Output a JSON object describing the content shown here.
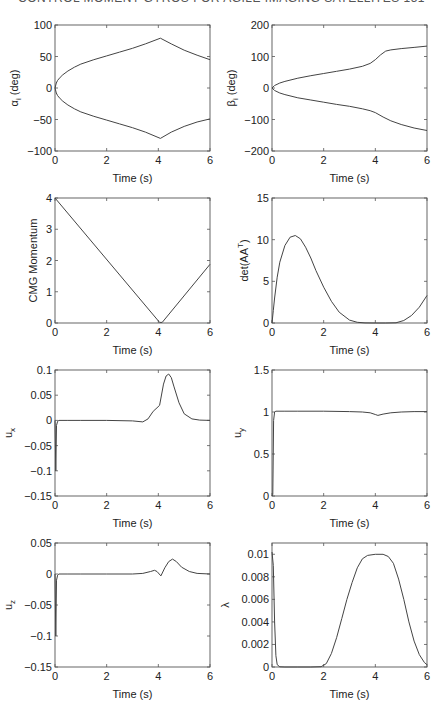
{
  "page": {
    "running_head": "CONTROL MOMENT GYROS FOR AGILE IMAGING SATELLITES 151"
  },
  "chart_data": [
    {
      "id": "alpha",
      "type": "line",
      "title": "",
      "xlabel": "Time (s)",
      "ylabel": "α_i (deg)",
      "ylabel_main": "α",
      "ylabel_sub": "i",
      "ylabel_tail": " (deg)",
      "xlim": [
        0,
        6
      ],
      "ylim": [
        -100,
        100
      ],
      "xticks": [
        0,
        2,
        4,
        6
      ],
      "yticks": [
        -100,
        -50,
        0,
        50,
        100
      ],
      "xtick_labels": [
        "0",
        "2",
        "4",
        "6"
      ],
      "ytick_labels": [
        "−100",
        "−50",
        "0",
        "50",
        "100"
      ],
      "grid": false,
      "series": [
        {
          "name": "alpha_upper",
          "x": [
            0,
            0.05,
            0.1,
            0.2,
            0.3,
            0.5,
            0.75,
            1,
            1.5,
            2,
            2.5,
            3,
            3.5,
            4.08,
            4.5,
            5,
            5.5,
            6
          ],
          "y": [
            0,
            8,
            12,
            17,
            21,
            27,
            33,
            38,
            45,
            51,
            57,
            63,
            70,
            79,
            70,
            60,
            52,
            45
          ]
        },
        {
          "name": "alpha_lower",
          "x": [
            0,
            0.05,
            0.1,
            0.2,
            0.3,
            0.5,
            0.75,
            1,
            1.5,
            2,
            2.5,
            3,
            3.5,
            4.08,
            4.5,
            5,
            5.5,
            6
          ],
          "y": [
            0,
            -8,
            -12,
            -17,
            -21,
            -27,
            -33,
            -38,
            -45,
            -51,
            -57,
            -63,
            -70,
            -80,
            -70,
            -61,
            -54,
            -49
          ]
        }
      ]
    },
    {
      "id": "beta",
      "type": "line",
      "title": "",
      "xlabel": "Time (s)",
      "ylabel": "β_i (deg)",
      "ylabel_main": "β",
      "ylabel_sub": "i",
      "ylabel_tail": " (deg)",
      "xlim": [
        0,
        6
      ],
      "ylim": [
        -200,
        200
      ],
      "xticks": [
        0,
        2,
        4,
        6
      ],
      "yticks": [
        -200,
        -100,
        0,
        100,
        200
      ],
      "xtick_labels": [
        "0",
        "2",
        "4",
        "6"
      ],
      "ytick_labels": [
        "−200",
        "−100",
        "0",
        "100",
        "200"
      ],
      "grid": false,
      "series": [
        {
          "name": "beta_upper",
          "x": [
            0,
            0.1,
            0.3,
            0.5,
            1,
            1.5,
            2,
            2.5,
            3,
            3.5,
            3.8,
            4,
            4.2,
            4.4,
            4.6,
            5,
            5.5,
            6
          ],
          "y": [
            0,
            8,
            16,
            21,
            31,
            39,
            46,
            53,
            60,
            69,
            78,
            90,
            105,
            117,
            121,
            125,
            129,
            133
          ]
        },
        {
          "name": "beta_lower",
          "x": [
            0,
            0.1,
            0.3,
            0.5,
            1,
            1.5,
            2,
            2.5,
            3,
            3.5,
            3.8,
            4,
            4.3,
            4.6,
            5,
            5.5,
            6
          ],
          "y": [
            0,
            -8,
            -16,
            -21,
            -31,
            -38,
            -45,
            -52,
            -58,
            -66,
            -72,
            -78,
            -92,
            -104,
            -116,
            -127,
            -135
          ]
        }
      ]
    },
    {
      "id": "cmg_momentum",
      "type": "line",
      "title": "",
      "xlabel": "Time (s)",
      "ylabel": "CMG Momentum",
      "ylabel_main": "CMG Momentum",
      "ylabel_sub": "",
      "ylabel_tail": "",
      "xlim": [
        0,
        6
      ],
      "ylim": [
        0,
        4
      ],
      "xticks": [
        0,
        2,
        4,
        6
      ],
      "yticks": [
        0,
        1,
        2,
        3,
        4
      ],
      "xtick_labels": [
        "0",
        "2",
        "4",
        "6"
      ],
      "ytick_labels": [
        "0",
        "1",
        "2",
        "3",
        "4"
      ],
      "grid": false,
      "series": [
        {
          "name": "momentum",
          "x": [
            0,
            4.05,
            4.15,
            6
          ],
          "y": [
            4,
            0.02,
            0.02,
            1.88
          ]
        }
      ]
    },
    {
      "id": "det_AAT",
      "type": "line",
      "title": "",
      "xlabel": "Time (s)",
      "ylabel": "det(AA^T)",
      "ylabel_main": "det(AA",
      "ylabel_sup": "T",
      "ylabel_tail": ")",
      "xlim": [
        0,
        6
      ],
      "ylim": [
        0,
        15
      ],
      "xticks": [
        0,
        2,
        4,
        6
      ],
      "yticks": [
        0,
        5,
        10,
        15
      ],
      "xtick_labels": [
        "0",
        "2",
        "4",
        "6"
      ],
      "ytick_labels": [
        "0",
        "5",
        "10",
        "15"
      ],
      "grid": false,
      "series": [
        {
          "name": "det",
          "x": [
            0,
            0.05,
            0.1,
            0.2,
            0.3,
            0.5,
            0.7,
            0.9,
            1.1,
            1.3,
            1.5,
            1.7,
            2,
            2.3,
            2.6,
            3,
            3.3,
            3.6,
            4,
            4.4,
            4.8,
            5.1,
            5.4,
            5.7,
            6
          ],
          "y": [
            0,
            1.5,
            3,
            5.5,
            7.3,
            9.3,
            10.3,
            10.5,
            10.1,
            9.1,
            7.8,
            6.3,
            4.3,
            2.6,
            1.3,
            0.35,
            0.08,
            0.01,
            0,
            0,
            0.02,
            0.3,
            0.9,
            1.9,
            3.3
          ]
        }
      ]
    },
    {
      "id": "u_x",
      "type": "line",
      "title": "",
      "xlabel": "Time (s)",
      "ylabel": "u_x",
      "ylabel_main": "u",
      "ylabel_sub": "x",
      "ylabel_tail": "",
      "xlim": [
        0,
        6
      ],
      "ylim": [
        -0.15,
        0.1
      ],
      "xticks": [
        0,
        2,
        4,
        6
      ],
      "yticks": [
        -0.15,
        -0.1,
        -0.05,
        0,
        0.05,
        0.1
      ],
      "xtick_labels": [
        "0",
        "2",
        "4",
        "6"
      ],
      "ytick_labels": [
        "−0.15",
        "−0.1",
        "−0.05",
        "0",
        "0.05",
        "0.1"
      ],
      "grid": false,
      "series": [
        {
          "name": "ux",
          "x": [
            0,
            0.03,
            0.06,
            0.1,
            0.15,
            0.5,
            1,
            2,
            3,
            3.4,
            3.6,
            3.8,
            3.95,
            4.05,
            4.2,
            4.3,
            4.4,
            4.5,
            4.6,
            4.8,
            5,
            5.3,
            5.6,
            6
          ],
          "y": [
            0,
            -0.1,
            -0.01,
            -0.002,
            0,
            0,
            0,
            0,
            -0.001,
            -0.003,
            0.003,
            0.018,
            0.025,
            0.03,
            0.072,
            0.088,
            0.092,
            0.085,
            0.068,
            0.035,
            0.013,
            0.003,
            0.0005,
            0
          ]
        }
      ]
    },
    {
      "id": "u_y",
      "type": "line",
      "title": "",
      "xlabel": "Time (s)",
      "ylabel": "u_y",
      "ylabel_main": "u",
      "ylabel_sub": "y",
      "ylabel_tail": "",
      "xlim": [
        0,
        6
      ],
      "ylim": [
        0,
        1.5
      ],
      "xticks": [
        0,
        2,
        4,
        6
      ],
      "yticks": [
        0,
        0.5,
        1,
        1.5
      ],
      "xtick_labels": [
        "0",
        "2",
        "4",
        "6"
      ],
      "ytick_labels": [
        "0",
        "0.5",
        "1",
        "1.5"
      ],
      "grid": false,
      "series": [
        {
          "name": "uy",
          "x": [
            0,
            0.03,
            0.06,
            0.1,
            0.15,
            0.5,
            1,
            2,
            3,
            3.5,
            3.8,
            4,
            4.1,
            4.3,
            4.6,
            5,
            5.5,
            6
          ],
          "y": [
            0,
            0.02,
            0.9,
            1.0,
            1.01,
            1.01,
            1.01,
            1.01,
            1.005,
            1.0,
            0.99,
            0.97,
            0.96,
            0.975,
            0.99,
            1.0,
            1.005,
            1.005
          ]
        }
      ]
    },
    {
      "id": "u_z",
      "type": "line",
      "title": "",
      "xlabel": "Time (s)",
      "ylabel": "u_z",
      "ylabel_main": "u",
      "ylabel_sub": "z",
      "ylabel_tail": "",
      "xlim": [
        0,
        6
      ],
      "ylim": [
        -0.15,
        0.05
      ],
      "xticks": [
        0,
        2,
        4,
        6
      ],
      "yticks": [
        -0.15,
        -0.1,
        -0.05,
        0,
        0.05
      ],
      "xtick_labels": [
        "0",
        "2",
        "4",
        "6"
      ],
      "ytick_labels": [
        "−0.15",
        "−0.1",
        "−0.05",
        "0",
        "0.05"
      ],
      "grid": false,
      "series": [
        {
          "name": "uz",
          "x": [
            0,
            0.03,
            0.06,
            0.1,
            0.15,
            0.5,
            1,
            2,
            3,
            3.4,
            3.7,
            3.85,
            3.95,
            4.1,
            4.25,
            4.4,
            4.55,
            4.7,
            4.9,
            5.2,
            5.5,
            6
          ],
          "y": [
            0,
            -0.1,
            -0.01,
            -0.002,
            0,
            0,
            0,
            0,
            0,
            0.001,
            0.004,
            0.006,
            0.004,
            -0.003,
            0.01,
            0.02,
            0.024,
            0.02,
            0.011,
            0.004,
            0.001,
            0
          ]
        }
      ]
    },
    {
      "id": "lambda",
      "type": "line",
      "title": "",
      "xlabel": "Time (s)",
      "ylabel": "λ",
      "ylabel_main": "λ",
      "ylabel_sub": "",
      "ylabel_tail": "",
      "xlim": [
        0,
        6
      ],
      "ylim": [
        0,
        0.011
      ],
      "xticks": [
        0,
        2,
        4,
        6
      ],
      "yticks": [
        0,
        0.002,
        0.004,
        0.006,
        0.008,
        0.01
      ],
      "xtick_labels": [
        "0",
        "2",
        "4",
        "6"
      ],
      "ytick_labels": [
        "0",
        "0.002",
        "0.004",
        "0.006",
        "0.008",
        "0.01"
      ],
      "grid": false,
      "series": [
        {
          "name": "lambda",
          "x": [
            0,
            0.05,
            0.1,
            0.15,
            0.2,
            0.3,
            0.5,
            1,
            1.5,
            1.9,
            2.1,
            2.3,
            2.5,
            2.7,
            2.9,
            3.1,
            3.3,
            3.5,
            3.7,
            4,
            4.3,
            4.5,
            4.7,
            4.9,
            5.1,
            5.3,
            5.5,
            5.7,
            5.9,
            6
          ],
          "y": [
            0.0102,
            0.009,
            0.004,
            0.001,
            0.0002,
            2e-05,
            0,
            0,
            0,
            3e-05,
            0.0003,
            0.0012,
            0.0026,
            0.0043,
            0.006,
            0.0075,
            0.0088,
            0.0096,
            0.0099,
            0.01,
            0.01,
            0.0098,
            0.0092,
            0.0078,
            0.006,
            0.004,
            0.0023,
            0.0011,
            0.0004,
            0.0002
          ]
        }
      ]
    }
  ]
}
